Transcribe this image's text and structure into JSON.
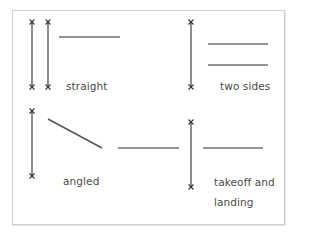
{
  "diagram": {
    "title": "",
    "colors": {
      "line": "#707070",
      "marker": "#333333",
      "text": "#4a4a4a",
      "frame": "#cfcfcf"
    },
    "panels": [
      {
        "id": "straight",
        "label": "straight",
        "runways": [
          {
            "type": "vertical",
            "x": 32,
            "y1": 23,
            "y2": 86
          },
          {
            "type": "vertical",
            "x": 48,
            "y1": 23,
            "y2": 86
          }
        ],
        "segments": [
          {
            "x1": 59,
            "y1": 37,
            "x2": 120,
            "y2": 37
          }
        ]
      },
      {
        "id": "two-sides",
        "label": "two sides",
        "runways": [
          {
            "type": "vertical",
            "x": 191,
            "y1": 23,
            "y2": 86
          }
        ],
        "segments": [
          {
            "x1": 208,
            "y1": 44,
            "x2": 268,
            "y2": 44
          },
          {
            "x1": 208,
            "y1": 65,
            "x2": 268,
            "y2": 65
          }
        ]
      },
      {
        "id": "angled",
        "label": "angled",
        "runways": [
          {
            "type": "vertical",
            "x": 32,
            "y1": 112,
            "y2": 175
          }
        ],
        "segments": [
          {
            "x1": 48,
            "y1": 119,
            "x2": 102,
            "y2": 148
          },
          {
            "x1": 118,
            "y1": 148,
            "x2": 179,
            "y2": 148
          }
        ]
      },
      {
        "id": "takeoff-and-landing",
        "label_line1": "takeoff and",
        "label_line2": "landing",
        "runways": [
          {
            "type": "vertical",
            "x": 191,
            "y1": 123,
            "y2": 186
          }
        ],
        "segments": [
          {
            "x1": 203,
            "y1": 148,
            "x2": 263,
            "y2": 148
          }
        ]
      }
    ]
  }
}
